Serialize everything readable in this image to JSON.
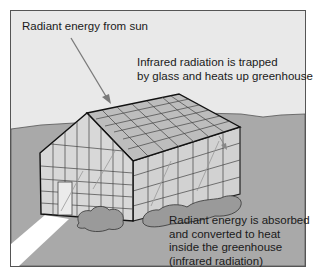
{
  "diagram": {
    "colors": {
      "sky": "#e9e9e9",
      "ground": "#a9a9a9",
      "frame_border": "#555555",
      "arrow": "#7a7a7a",
      "glass": "#cfcfcf",
      "roof": "#bdbdbd",
      "shrub": "#9a9a9a",
      "path": "#ffffff"
    },
    "labels": {
      "sun": {
        "lines": [
          "Radiant energy from sun"
        ]
      },
      "infrared": {
        "lines": [
          "Infrared radiation is trapped",
          "by glass and heats up greenhouse"
        ]
      },
      "absorbed": {
        "lines": [
          "Radiant energy is absorbed",
          "and converted to heat",
          "inside the greenhouse",
          "(infrared radiation)"
        ]
      }
    },
    "elements": [
      "sky",
      "ground",
      "greenhouse",
      "door",
      "shrubs",
      "path",
      "sun-arrow",
      "infrared-arrows"
    ]
  }
}
